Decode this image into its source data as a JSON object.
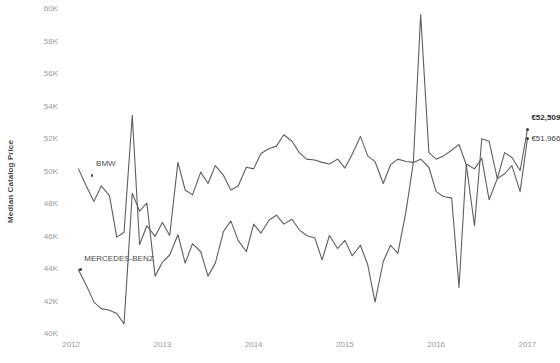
{
  "chart_data": {
    "type": "line",
    "title": "",
    "xlabel": "",
    "ylabel": "Median Catalog Price",
    "ylim": [
      40000,
      60000
    ],
    "ytick_labels": [
      "60K",
      "58K",
      "56K",
      "54K",
      "52K",
      "50K",
      "48K",
      "46K",
      "44K",
      "42K",
      "40K"
    ],
    "ytick_values": [
      60000,
      58000,
      56000,
      54000,
      52000,
      50000,
      48000,
      46000,
      44000,
      42000,
      40000
    ],
    "xtick_labels": [
      "2012",
      "2013",
      "2014",
      "2015",
      "2016",
      "2017"
    ],
    "xtick_values": [
      2012,
      2013,
      2014,
      2015,
      2016,
      2017
    ],
    "xlim": [
      2011.9,
      2017.05
    ],
    "grid": false,
    "legend_position": "inline-labels",
    "currency_symbol": "€",
    "series": [
      {
        "name": "BMW",
        "label": "BMW",
        "color": "#5e5e5e",
        "end_value_label": "€52,509",
        "end_value": 52509,
        "x": [
          2012.08,
          2012.17,
          2012.25,
          2012.33,
          2012.42,
          2012.5,
          2012.58,
          2012.67,
          2012.75,
          2012.83,
          2012.92,
          2013.0,
          2013.08,
          2013.17,
          2013.25,
          2013.33,
          2013.42,
          2013.5,
          2013.58,
          2013.67,
          2013.75,
          2013.83,
          2013.92,
          2014.0,
          2014.08,
          2014.17,
          2014.25,
          2014.33,
          2014.42,
          2014.5,
          2014.58,
          2014.67,
          2014.75,
          2014.83,
          2014.92,
          2015.0,
          2015.08,
          2015.17,
          2015.25,
          2015.33,
          2015.42,
          2015.5,
          2015.58,
          2015.67,
          2015.75,
          2015.83,
          2015.92,
          2016.0,
          2016.08,
          2016.17,
          2016.25,
          2016.33,
          2016.42,
          2016.5,
          2016.58,
          2016.67,
          2016.75,
          2016.83,
          2016.92,
          2017.0
        ],
        "values": [
          50100,
          49000,
          48100,
          49050,
          48450,
          45900,
          46200,
          53400,
          45450,
          46600,
          45950,
          46800,
          46000,
          50500,
          48800,
          48500,
          49900,
          49200,
          50300,
          49700,
          48800,
          49050,
          50200,
          50100,
          51050,
          51350,
          51500,
          52200,
          51800,
          51100,
          50700,
          50650,
          50500,
          50400,
          50700,
          50150,
          51000,
          52100,
          50900,
          50550,
          49200,
          50350,
          50700,
          50550,
          50500,
          59600,
          51100,
          50700,
          50900,
          51250,
          51600,
          50350,
          46600,
          51950,
          51800,
          49500,
          51100,
          50800,
          50000,
          52509
        ]
      },
      {
        "name": "Mercedes-Benz",
        "label": "MERCEDES-BENZ",
        "color": "#6c6c6c",
        "end_value_label": "€51,966",
        "end_value": 51966,
        "x": [
          2012.08,
          2012.17,
          2012.25,
          2012.33,
          2012.42,
          2012.5,
          2012.58,
          2012.67,
          2012.75,
          2012.83,
          2012.92,
          2013.0,
          2013.08,
          2013.17,
          2013.25,
          2013.33,
          2013.42,
          2013.5,
          2013.58,
          2013.67,
          2013.75,
          2013.83,
          2013.92,
          2014.0,
          2014.08,
          2014.17,
          2014.25,
          2014.33,
          2014.42,
          2014.5,
          2014.58,
          2014.67,
          2014.75,
          2014.83,
          2014.92,
          2015.0,
          2015.08,
          2015.17,
          2015.25,
          2015.33,
          2015.42,
          2015.5,
          2015.58,
          2015.67,
          2015.75,
          2015.83,
          2015.92,
          2016.0,
          2016.08,
          2016.17,
          2016.25,
          2016.33,
          2016.42,
          2016.5,
          2016.58,
          2016.67,
          2016.75,
          2016.83,
          2016.92,
          2017.0
        ],
        "values": [
          43900,
          42900,
          41900,
          41500,
          41400,
          41200,
          40550,
          48600,
          47500,
          48000,
          43500,
          44350,
          44800,
          46050,
          44300,
          45500,
          45000,
          43500,
          44300,
          46250,
          46900,
          45700,
          45000,
          46700,
          46150,
          46950,
          47250,
          46700,
          47000,
          46350,
          46000,
          45850,
          44500,
          46000,
          45200,
          45700,
          44750,
          45400,
          44200,
          41900,
          44400,
          45400,
          44900,
          47500,
          50500,
          50700,
          50200,
          48700,
          48400,
          48300,
          42800,
          50400,
          50100,
          50750,
          48200,
          49500,
          49800,
          50300,
          48700,
          51966
        ]
      }
    ],
    "annotations": [
      {
        "name": "bmw-series-label",
        "text": "BMW",
        "anchor_x": 2012.23,
        "anchor_y": 49700
      },
      {
        "name": "mercedes-series-label",
        "text": "MERCEDES-BENZ",
        "anchor_x": 2012.1,
        "anchor_y": 43900
      },
      {
        "name": "bmw-endpoint-value",
        "text": "€52,509",
        "anchor_x": 2017.0,
        "anchor_y": 52509
      },
      {
        "name": "mercedes-endpoint-value",
        "text": "€51,966",
        "anchor_x": 2017.0,
        "anchor_y": 51966
      }
    ]
  }
}
